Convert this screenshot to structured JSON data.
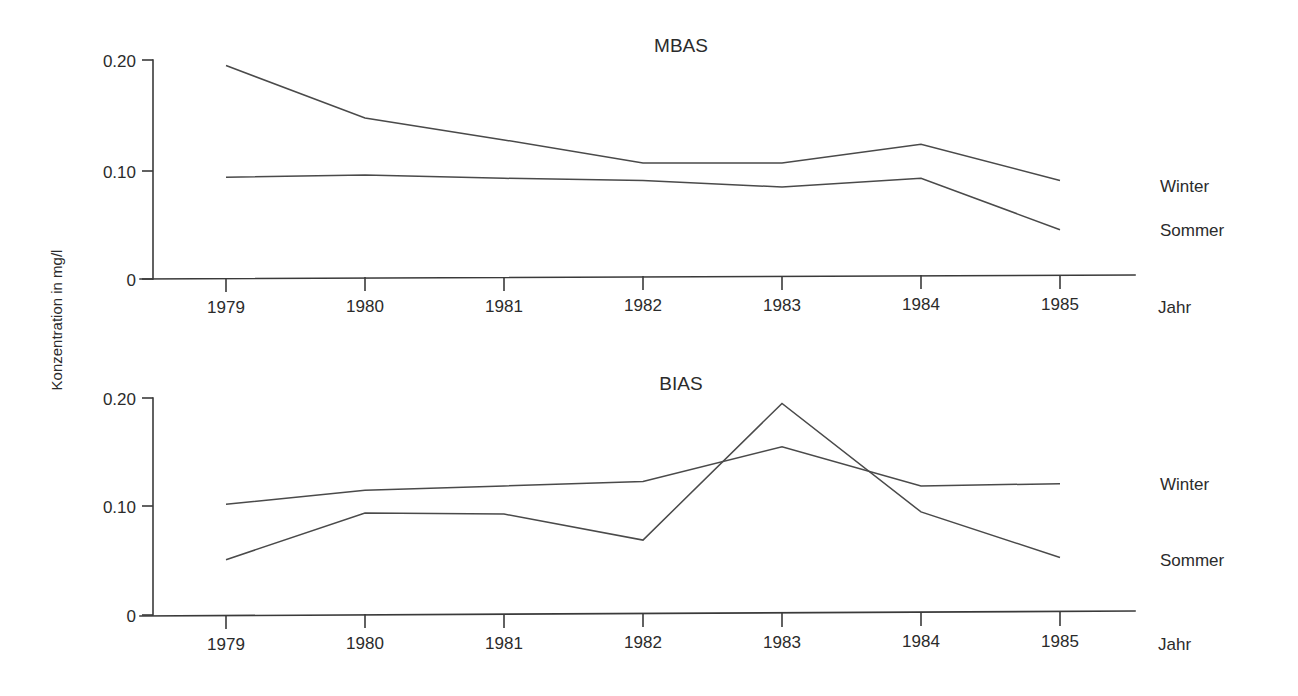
{
  "figure": {
    "y_axis_label": "Konzentration in mg/l",
    "x_axis_name": "Jahr",
    "line_color": "#4a4a4a",
    "axis_color": "#3a3a3a",
    "background": "#ffffff"
  },
  "charts": [
    {
      "title": "MBAS",
      "x_axis_name": "Jahr",
      "ytick_labels": [
        "0.20",
        "0.10",
        "0"
      ],
      "ytick_values": [
        0.2,
        0.1,
        0
      ],
      "xtick_labels": [
        "1979",
        "1980",
        "1981",
        "1982",
        "1983",
        "1984",
        "1985"
      ],
      "series_labels": [
        "Winter",
        "Sommer"
      ]
    },
    {
      "title": "BIAS",
      "x_axis_name": "Jahr",
      "ytick_labels": [
        "0.20",
        "0.10",
        "0"
      ],
      "ytick_values": [
        0.2,
        0.1,
        0
      ],
      "xtick_labels": [
        "1979",
        "1980",
        "1981",
        "1982",
        "1983",
        "1984",
        "1985"
      ],
      "series_labels": [
        "Winter",
        "Sommer"
      ]
    }
  ],
  "chart_data": [
    {
      "type": "line",
      "title": "MBAS",
      "xlabel": "Jahr",
      "ylabel": "Konzentration in mg/l",
      "categories": [
        "1979",
        "1980",
        "1981",
        "1982",
        "1983",
        "1984",
        "1985"
      ],
      "x": [
        1979,
        1980,
        1981,
        1982,
        1983,
        1984,
        1985
      ],
      "ylim": [
        0,
        0.2
      ],
      "yticks": [
        0,
        0.1,
        0.2
      ],
      "ytick_labels": [
        "0",
        "0.10",
        "0.20"
      ],
      "grid": false,
      "legend": "right-inline",
      "series": [
        {
          "name": "Winter",
          "values": [
            0.195,
            0.147,
            0.127,
            0.106,
            0.106,
            0.123,
            0.09
          ]
        },
        {
          "name": "Sommer",
          "values": [
            0.093,
            0.095,
            0.092,
            0.09,
            0.084,
            0.092,
            0.045
          ]
        }
      ]
    },
    {
      "type": "line",
      "title": "BIAS",
      "xlabel": "Jahr",
      "ylabel": "Konzentration in mg/l",
      "categories": [
        "1979",
        "1980",
        "1981",
        "1982",
        "1983",
        "1984",
        "1985"
      ],
      "x": [
        1979,
        1980,
        1981,
        1982,
        1983,
        1984,
        1985
      ],
      "ylim": [
        0,
        0.2
      ],
      "yticks": [
        0,
        0.1,
        0.2
      ],
      "ytick_labels": [
        "0",
        "0.10",
        "0.20"
      ],
      "grid": false,
      "legend": "right-inline",
      "series": [
        {
          "name": "Winter",
          "values": [
            0.102,
            0.115,
            0.119,
            0.123,
            0.155,
            0.119,
            0.121
          ]
        },
        {
          "name": "Sommer",
          "values": [
            0.051,
            0.094,
            0.093,
            0.069,
            0.195,
            0.095,
            0.053
          ]
        }
      ]
    }
  ]
}
